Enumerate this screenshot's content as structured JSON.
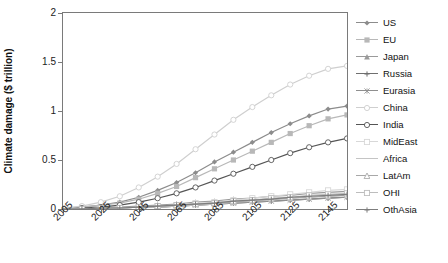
{
  "chart_data": {
    "type": "line",
    "title": "",
    "xlabel": "",
    "ylabel": "Climate damage ($ trillion)",
    "xlim": [
      2005,
      2155
    ],
    "ylim": [
      0,
      2
    ],
    "grid": false,
    "legend_position": "right",
    "x_ticks": [
      "2005",
      "2025",
      "2045",
      "2065",
      "2085",
      "2105",
      "2125",
      "2145"
    ],
    "y_ticks": [
      "0",
      "0.5",
      "1",
      "1.5",
      "2"
    ],
    "x": [
      2005,
      2015,
      2025,
      2035,
      2045,
      2055,
      2065,
      2075,
      2085,
      2095,
      2105,
      2115,
      2125,
      2135,
      2145,
      2155
    ],
    "series": [
      {
        "name": "US",
        "color": "#8c8c8c",
        "marker": "diamond",
        "values": [
          0.01,
          0.02,
          0.04,
          0.07,
          0.12,
          0.19,
          0.27,
          0.37,
          0.48,
          0.58,
          0.68,
          0.78,
          0.87,
          0.95,
          1.02,
          1.05
        ]
      },
      {
        "name": "EU",
        "color": "#b8b8b8",
        "marker": "square",
        "values": [
          0.01,
          0.02,
          0.04,
          0.06,
          0.1,
          0.16,
          0.23,
          0.32,
          0.41,
          0.5,
          0.59,
          0.68,
          0.77,
          0.85,
          0.92,
          0.96
        ]
      },
      {
        "name": "Japan",
        "color": "#9a9a9a",
        "marker": "triangle",
        "values": [
          0.0,
          0.01,
          0.01,
          0.02,
          0.03,
          0.04,
          0.05,
          0.07,
          0.08,
          0.1,
          0.11,
          0.13,
          0.14,
          0.16,
          0.17,
          0.18
        ]
      },
      {
        "name": "Russia",
        "color": "#6f6f6f",
        "marker": "cross",
        "values": [
          0.0,
          0.0,
          0.01,
          0.01,
          0.02,
          0.02,
          0.03,
          0.04,
          0.05,
          0.06,
          0.07,
          0.08,
          0.09,
          0.1,
          0.11,
          0.12
        ]
      },
      {
        "name": "Eurasia",
        "color": "#8f8f8f",
        "marker": "star",
        "values": [
          0.0,
          0.0,
          0.01,
          0.01,
          0.02,
          0.02,
          0.03,
          0.04,
          0.05,
          0.06,
          0.07,
          0.08,
          0.09,
          0.1,
          0.11,
          0.12
        ]
      },
      {
        "name": "China",
        "color": "#cfcfcf",
        "marker": "circle-open",
        "values": [
          0.01,
          0.03,
          0.07,
          0.13,
          0.22,
          0.33,
          0.46,
          0.61,
          0.76,
          0.91,
          1.04,
          1.16,
          1.27,
          1.36,
          1.43,
          1.46
        ]
      },
      {
        "name": "India",
        "color": "#555555",
        "marker": "circle-open",
        "values": [
          0.0,
          0.01,
          0.02,
          0.04,
          0.07,
          0.11,
          0.16,
          0.22,
          0.29,
          0.36,
          0.43,
          0.5,
          0.57,
          0.63,
          0.68,
          0.72
        ]
      },
      {
        "name": "MidEast",
        "color": "#d8d8d8",
        "marker": "square-open",
        "values": [
          0.0,
          0.0,
          0.01,
          0.01,
          0.02,
          0.03,
          0.04,
          0.06,
          0.07,
          0.09,
          0.11,
          0.13,
          0.15,
          0.17,
          0.19,
          0.2
        ]
      },
      {
        "name": "Africa",
        "color": "#c4c4c4",
        "marker": "none",
        "values": [
          0.0,
          0.0,
          0.01,
          0.01,
          0.02,
          0.02,
          0.03,
          0.04,
          0.05,
          0.07,
          0.08,
          0.09,
          0.11,
          0.12,
          0.13,
          0.14
        ]
      },
      {
        "name": "LatAm",
        "color": "#a8a8a8",
        "marker": "triangle-open",
        "values": [
          0.0,
          0.0,
          0.01,
          0.01,
          0.02,
          0.03,
          0.04,
          0.05,
          0.06,
          0.07,
          0.09,
          0.1,
          0.11,
          0.12,
          0.13,
          0.14
        ]
      },
      {
        "name": "OHI",
        "color": "#bdbdbd",
        "marker": "square-open",
        "values": [
          0.0,
          0.0,
          0.01,
          0.01,
          0.02,
          0.03,
          0.04,
          0.05,
          0.06,
          0.08,
          0.09,
          0.11,
          0.12,
          0.14,
          0.15,
          0.16
        ]
      },
      {
        "name": "OthAsia",
        "color": "#7d7d7d",
        "marker": "cross",
        "values": [
          0.0,
          0.0,
          0.01,
          0.01,
          0.02,
          0.03,
          0.04,
          0.05,
          0.06,
          0.08,
          0.09,
          0.1,
          0.12,
          0.13,
          0.14,
          0.15
        ]
      }
    ]
  }
}
